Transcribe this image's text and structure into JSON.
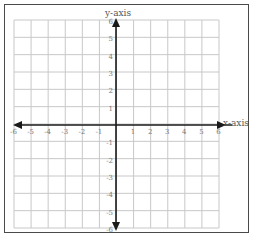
{
  "diagram": {
    "type": "coordinate-plane",
    "x_axis_label": "x-axis",
    "y_axis_label": "y-axis",
    "x_range": [
      -6,
      6
    ],
    "y_range": [
      -6,
      6
    ],
    "x_ticks": [
      "-6",
      "-5",
      "-4",
      "-3",
      "-2",
      "-1",
      "1",
      "2",
      "3",
      "4",
      "5",
      "6"
    ],
    "y_ticks": [
      "6",
      "5",
      "4",
      "3",
      "2",
      "1",
      "-1",
      "-2",
      "-3",
      "-4",
      "-5",
      "-6"
    ],
    "grid_color": "#c8c8c8",
    "axis_color": "#1a1a1a",
    "border_color": "#4a4a4a"
  }
}
